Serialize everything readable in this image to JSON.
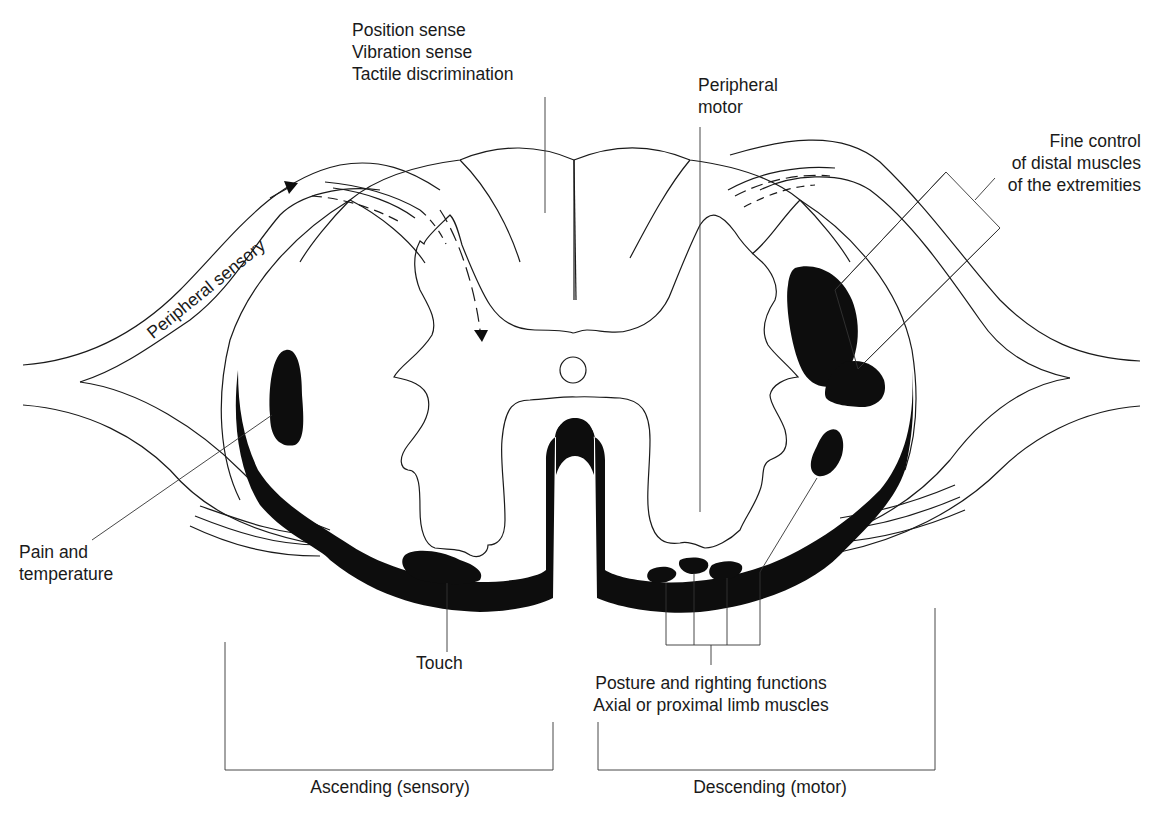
{
  "figure": {
    "colors": {
      "ink": "#1a1a1a",
      "fill": "#0d0d0d",
      "background": "#ffffff"
    }
  },
  "labels": {
    "dorsal_column": {
      "line1": "Position sense",
      "line2": "Vibration sense",
      "line3": "Tactile discrimination"
    },
    "peripheral_motor": {
      "line1": "Peripheral",
      "line2": "motor"
    },
    "peripheral_sensory": "Peripheral sensory",
    "fine_control": {
      "line1": "Fine control",
      "line2": "of distal muscles",
      "line3": "of the extremities"
    },
    "pain_temperature": {
      "line1": "Pain and",
      "line2": "temperature"
    },
    "touch": "Touch",
    "posture": {
      "line1": "Posture and righting functions",
      "line2": "Axial or proximal limb muscles"
    }
  },
  "brackets": {
    "ascending": "Ascending (sensory)",
    "descending": "Descending (motor)"
  }
}
